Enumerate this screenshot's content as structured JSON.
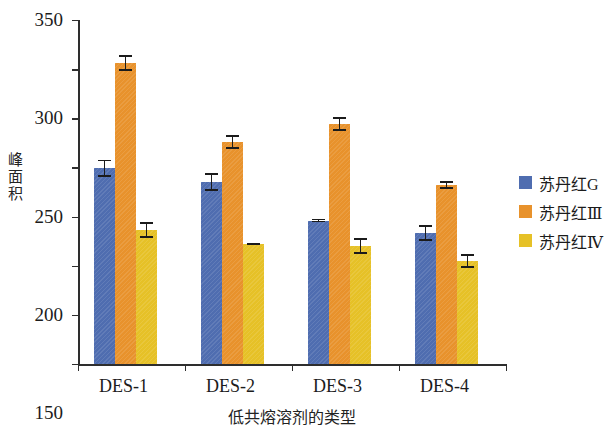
{
  "chart_data": {
    "type": "bar",
    "title": "",
    "xlabel": "低共熔溶剂的类型",
    "ylabel": "峰面积",
    "categories": [
      "DES-1",
      "DES-2",
      "DES-3",
      "DES-4"
    ],
    "ylim": [
      0,
      350
    ],
    "yticks": [
      0,
      50,
      100,
      150,
      200,
      250,
      300,
      350
    ],
    "grid": false,
    "legend_position": "right",
    "series": [
      {
        "name": "苏丹红G",
        "color": "#4f6db0",
        "values": [
          199,
          185,
          146,
          133
        ],
        "errors": [
          9,
          9,
          2,
          8
        ]
      },
      {
        "name": "苏丹红Ⅲ",
        "color": "#e8922c",
        "values": [
          306,
          226,
          244,
          182
        ],
        "errors": [
          8,
          7,
          7,
          4
        ]
      },
      {
        "name": "苏丹红Ⅳ",
        "color": "#e6c127",
        "values": [
          136,
          122,
          120,
          105
        ],
        "errors": [
          8,
          1,
          8,
          7
        ]
      }
    ]
  },
  "axis": {
    "ytick_labels": [
      "0",
      "50",
      "100",
      "150",
      "200",
      "250",
      "300",
      "350"
    ]
  },
  "legend": {
    "items": [
      {
        "label": "苏丹红G"
      },
      {
        "label": "苏丹红Ⅲ"
      },
      {
        "label": "苏丹红Ⅳ"
      }
    ]
  },
  "ylabel_chars": [
    "峰",
    "面",
    "积"
  ]
}
